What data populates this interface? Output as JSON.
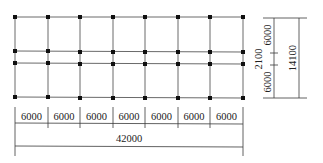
{
  "diagram": {
    "type": "structural-column-grid-plan",
    "colors": {
      "grid": "#6a6a6a",
      "column": "#111111",
      "dimension": "#3a3a3a",
      "text": "#222222"
    },
    "bays_x": 7,
    "bays_y": 3,
    "bottom_dimensions": {
      "spans": [
        "6000",
        "6000",
        "6000",
        "6000",
        "6000",
        "6000",
        "6000"
      ],
      "total": "42000"
    },
    "right_dimensions": {
      "spans": [
        "6000",
        "2100",
        "6000"
      ],
      "total": "14100"
    }
  }
}
